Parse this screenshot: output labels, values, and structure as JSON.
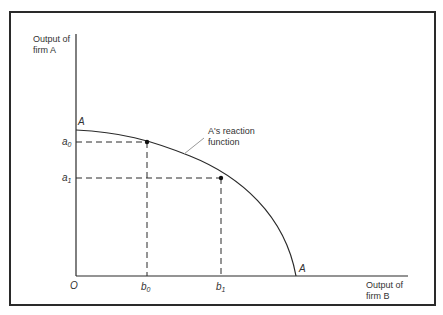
{
  "diagram": {
    "y_axis_label_line1": "Output of",
    "y_axis_label_line2": "firm A",
    "x_axis_label_line1": "Output of",
    "x_axis_label_line2": "firm B",
    "origin_label": "O",
    "curve_label_top": "A",
    "curve_label_bottom": "A",
    "curve_annotation_line1": "A's reaction",
    "curve_annotation_line2": "function",
    "y_ticks": [
      {
        "base": "a",
        "sub": "0"
      },
      {
        "base": "a",
        "sub": "1"
      }
    ],
    "x_ticks": [
      {
        "base": "b",
        "sub": "0"
      },
      {
        "base": "b",
        "sub": "1"
      }
    ],
    "colors": {
      "line": "#2a2a2a",
      "leader": "#9a9a9a"
    }
  }
}
